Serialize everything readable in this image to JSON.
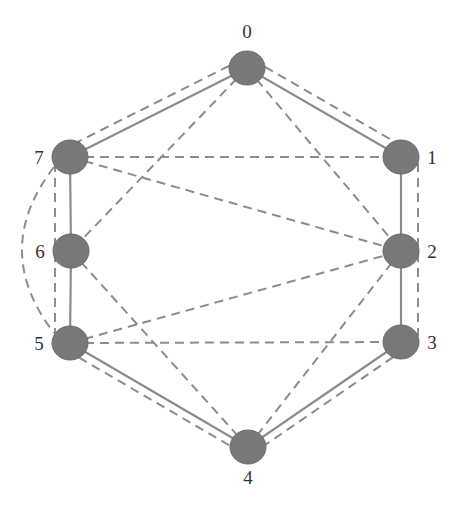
{
  "diagram": {
    "type": "graph",
    "colors": {
      "node_fill": "#787878",
      "node_stroke": "#6a6a6a",
      "edge_solid": "#8c8c8c",
      "edge_dashed": "#8c8c8c",
      "label": "#333333"
    },
    "nodes": [
      {
        "id": "0",
        "label": "0",
        "x": 247,
        "y": 68,
        "lx": 247,
        "ly": 38,
        "anchor": "middle"
      },
      {
        "id": "1",
        "label": "1",
        "x": 401,
        "y": 157,
        "lx": 432,
        "ly": 164,
        "anchor": "middle"
      },
      {
        "id": "2",
        "label": "2",
        "x": 401,
        "y": 251,
        "lx": 432,
        "ly": 258,
        "anchor": "middle"
      },
      {
        "id": "3",
        "label": "3",
        "x": 401,
        "y": 342,
        "lx": 432,
        "ly": 349,
        "anchor": "middle"
      },
      {
        "id": "4",
        "label": "4",
        "x": 248,
        "y": 447,
        "lx": 248,
        "ly": 484,
        "anchor": "middle"
      },
      {
        "id": "5",
        "label": "5",
        "x": 70,
        "y": 343,
        "lx": 39,
        "ly": 350,
        "anchor": "middle"
      },
      {
        "id": "6",
        "label": "6",
        "x": 71,
        "y": 251,
        "lx": 40,
        "ly": 258,
        "anchor": "middle"
      },
      {
        "id": "7",
        "label": "7",
        "x": 70,
        "y": 157,
        "lx": 39,
        "ly": 164,
        "anchor": "middle"
      }
    ],
    "solid_edges": [
      [
        "0",
        "1"
      ],
      [
        "1",
        "2"
      ],
      [
        "2",
        "3"
      ],
      [
        "3",
        "4"
      ],
      [
        "4",
        "5"
      ],
      [
        "5",
        "6"
      ],
      [
        "6",
        "7"
      ],
      [
        "7",
        "0"
      ]
    ],
    "dashed_edges": [
      {
        "from": "0",
        "to": "7",
        "offset": 10
      },
      {
        "from": "0",
        "to": "1",
        "offset": -10
      },
      {
        "from": "0",
        "to": "6"
      },
      {
        "from": "0",
        "to": "2"
      },
      {
        "from": "7",
        "to": "1"
      },
      {
        "from": "7",
        "to": "2"
      },
      {
        "from": "7",
        "to": "5",
        "straight_x": 55
      },
      {
        "from": "7",
        "to": "5",
        "curve": true
      },
      {
        "from": "1",
        "to": "3",
        "straight_x": 418
      },
      {
        "from": "6",
        "to": "4"
      },
      {
        "from": "5",
        "to": "2"
      },
      {
        "from": "5",
        "to": "3"
      },
      {
        "from": "5",
        "to": "4",
        "offset": 8
      },
      {
        "from": "2",
        "to": "4"
      },
      {
        "from": "3",
        "to": "4",
        "offset": -8
      }
    ]
  }
}
